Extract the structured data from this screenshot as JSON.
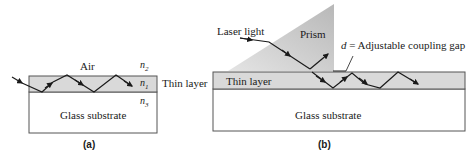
{
  "figure": {
    "panel_a": {
      "caption": "(a)",
      "air_label": "Air",
      "thin_layer_label": "Thin layer",
      "substrate_label": "Glass substrate",
      "n2": "n",
      "n2_sub": "2",
      "n1": "n",
      "n1_sub": "1",
      "n3": "n",
      "n3_sub": "3"
    },
    "panel_b": {
      "caption": "(b)",
      "laser_label": "Laser light",
      "prism_label": "Prism",
      "gap_var": "d",
      "gap_label": " = Adjustable coupling gap",
      "thin_layer_label": "Thin layer",
      "substrate_label": "Glass substrate"
    },
    "colors": {
      "layer_fill": "#d9d9d9",
      "prism_fill": "#c8c8c8",
      "line": "#1a1a1a",
      "border": "#555555"
    }
  }
}
